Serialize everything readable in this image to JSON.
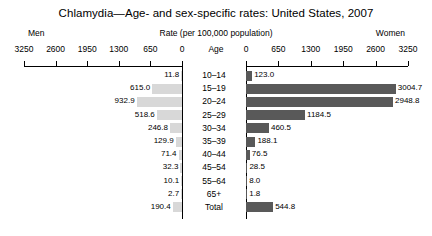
{
  "header": {
    "title": "Chlamydia—Age- and sex-specific rates: United States, 2007",
    "left_group_label": "Men",
    "rate_label": "Rate (per 100,000 population)",
    "right_group_label": "Women",
    "age_axis_label": "Age"
  },
  "chart_data": {
    "type": "bar",
    "orientation": "horizontal-pyramid",
    "title": "Chlamydia—Age- and sex-specific rates: United States, 2007",
    "xlabel": "Rate (per 100,000 population)",
    "ylabel": "Age",
    "categories": [
      "10–14",
      "15–19",
      "20–24",
      "25–29",
      "30–34",
      "35–39",
      "40–44",
      "45–54",
      "55–64",
      "65+",
      "Total"
    ],
    "series": [
      {
        "name": "Men",
        "side": "left",
        "color": "#d8d8d8",
        "values": [
          11.8,
          615.0,
          932.9,
          518.6,
          246.8,
          129.9,
          71.4,
          32.3,
          10.1,
          2.7,
          190.4
        ],
        "labels": [
          "11.8",
          "615.0",
          "932.9",
          "518.6",
          "246.8",
          "129.9",
          "71.4",
          "32.3",
          "10.1",
          "2.7",
          "190.4"
        ]
      },
      {
        "name": "Women",
        "side": "right",
        "color": "#595959",
        "values": [
          123.0,
          3004.7,
          2948.8,
          1184.5,
          460.5,
          188.1,
          76.5,
          28.5,
          8.0,
          1.8,
          544.8
        ],
        "labels": [
          "123.0",
          "3004.7",
          "2948.8",
          "1184.5",
          "460.5",
          "188.1",
          "76.5",
          "28.5",
          "8.0",
          "1.8",
          "544.8"
        ]
      }
    ],
    "left_ticks": [
      3250,
      2600,
      1950,
      1300,
      650,
      0
    ],
    "left_tick_labels": [
      "3250",
      "2600",
      "1950",
      "1300",
      "650",
      "0"
    ],
    "right_ticks": [
      0,
      650,
      1300,
      1950,
      2600,
      3250
    ],
    "right_tick_labels": [
      "0",
      "650",
      "1300",
      "1950",
      "2600",
      "3250"
    ],
    "xlim": [
      0,
      3500
    ],
    "grid": false,
    "legend": "none"
  }
}
